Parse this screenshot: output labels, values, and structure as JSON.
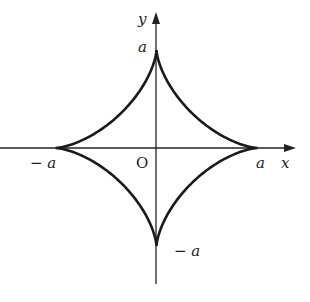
{
  "diagram": {
    "type": "astroid",
    "equation": "x^(2/3) + y^(2/3) = a^(2/3)",
    "origin_label": "O",
    "axes": {
      "x_label": "x",
      "y_label": "y"
    },
    "tick_labels": {
      "x_pos": "a",
      "x_neg": "− a",
      "y_pos": "a",
      "y_neg": "− a"
    },
    "colors": {
      "curve": "#1a1a1a",
      "axis": "#222222",
      "text": "#222222",
      "background": "#ffffff"
    }
  }
}
